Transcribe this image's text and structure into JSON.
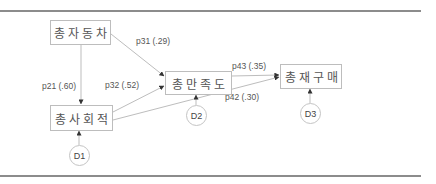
{
  "diagram": {
    "type": "path-model",
    "nodes": [
      {
        "id": "n1",
        "label": "총자동차"
      },
      {
        "id": "n2",
        "label": "총사회적"
      },
      {
        "id": "n3",
        "label": "총만족도"
      },
      {
        "id": "n4",
        "label": "총재구매"
      }
    ],
    "disturbances": [
      {
        "id": "D1",
        "label": "D1",
        "target": "n2"
      },
      {
        "id": "D2",
        "label": "D2",
        "target": "n3"
      },
      {
        "id": "D3",
        "label": "D3",
        "target": "n4"
      }
    ],
    "paths": [
      {
        "from": "n1",
        "to": "n3",
        "label": "p31 (.29)"
      },
      {
        "from": "n1",
        "to": "n2",
        "label": "p21 (.60)"
      },
      {
        "from": "n2",
        "to": "n3",
        "label": "p32 (.52)"
      },
      {
        "from": "n3",
        "to": "n4",
        "label": "p43 (.35)"
      },
      {
        "from": "n2",
        "to": "n4",
        "label": "p42 (.30)"
      }
    ],
    "colors": {
      "line": "#bdbdbd",
      "rule": "#8c8c8c",
      "text": "#555555"
    }
  }
}
